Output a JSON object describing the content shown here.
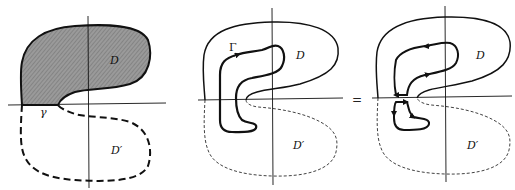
{
  "figure": {
    "panels": [
      {
        "id": "panel-1",
        "labels": {
          "region": "D",
          "reflected_region": "D′",
          "boundary_segment": "γ"
        },
        "region_fill": "#8f8f8f"
      },
      {
        "id": "panel-2",
        "labels": {
          "region": "D",
          "reflected_region": "D′",
          "contour": "Γ"
        }
      },
      {
        "id": "panel-3",
        "labels": {
          "region": "D",
          "reflected_region": "D′"
        }
      }
    ],
    "operator": "="
  },
  "colors": {
    "ink": "#111111",
    "shade": "#8f8f8f",
    "background": "#ffffff"
  }
}
